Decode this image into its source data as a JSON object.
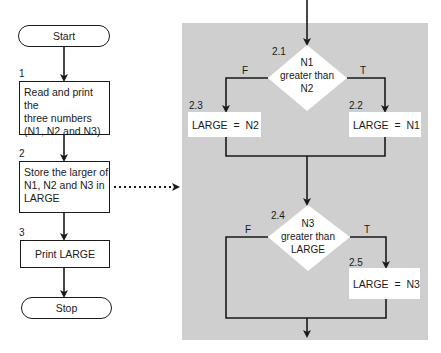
{
  "main_flow": {
    "start": {
      "label": "Start"
    },
    "steps": [
      {
        "number": "1",
        "text": [
          "Read and print the",
          "three numbers",
          "(N1, N2 and N3)"
        ]
      },
      {
        "number": "2",
        "text": [
          "Store the larger of",
          "N1, N2 and N3 in",
          "LARGE"
        ]
      },
      {
        "number": "3",
        "text": [
          "Print LARGE"
        ]
      }
    ],
    "stop": {
      "label": "Stop"
    }
  },
  "expansion": {
    "decision_1": {
      "number": "2.1",
      "text": [
        "N1",
        "greater than",
        "N2"
      ],
      "false_label": "F",
      "true_label": "T"
    },
    "box_false_1": {
      "number": "2.3",
      "text": "LARGE  =  N2"
    },
    "box_true_1": {
      "number": "2.2",
      "text": "LARGE  =  N1"
    },
    "decision_2": {
      "number": "2.4",
      "text": [
        "N3",
        "greater than",
        "LARGE"
      ],
      "false_label": "F",
      "true_label": "T"
    },
    "box_true_2": {
      "number": "2.5",
      "text": "LARGE  =  N3"
    }
  },
  "colors": {
    "panel": "#cfcfcf",
    "line": "#1a1a1a",
    "box": "#ffffff"
  }
}
